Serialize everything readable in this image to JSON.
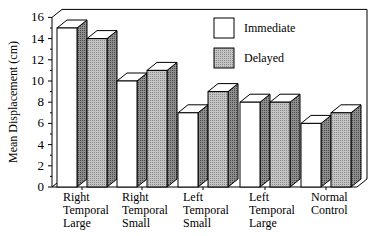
{
  "chart_data": {
    "type": "bar",
    "style": "3d-grouped",
    "title": "",
    "xlabel": "",
    "ylabel": "Mean Displacement (cm)",
    "ylim": [
      0,
      16
    ],
    "yticks": [
      0,
      2,
      4,
      6,
      8,
      10,
      12,
      14,
      16
    ],
    "grid": false,
    "legend_position": "upper-right-inside",
    "categories": [
      [
        "Right",
        "Temporal",
        "Large"
      ],
      [
        "Right",
        "Temporal",
        "Small"
      ],
      [
        "Left",
        "Temporal",
        "Small"
      ],
      [
        "Left",
        "Temporal",
        "Large"
      ],
      [
        "Normal",
        "Control"
      ]
    ],
    "series": [
      {
        "name": "Immediate",
        "values": [
          15,
          10,
          7,
          8,
          6
        ],
        "color": "#ffffff"
      },
      {
        "name": "Delayed",
        "values": [
          14,
          11,
          9,
          8,
          7
        ],
        "color": "#b8b8b8"
      }
    ]
  }
}
